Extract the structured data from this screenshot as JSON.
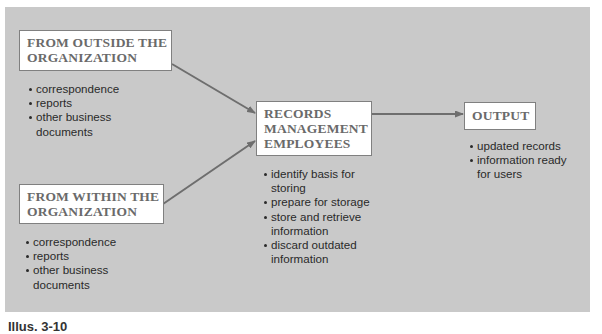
{
  "diagram": {
    "background_color": "#c9c9c9",
    "box_text_color": "#6a6a6a",
    "arrow_color": "#6e6e6e",
    "nodes": [
      {
        "id": "outside",
        "title_lines": [
          "FROM OUTSIDE THE",
          "ORGANIZATION"
        ],
        "items": [
          {
            "lines": [
              "correspondence"
            ]
          },
          {
            "lines": [
              "reports"
            ]
          },
          {
            "lines": [
              "other business",
              "documents"
            ]
          }
        ]
      },
      {
        "id": "within",
        "title_lines": [
          "FROM WITHIN THE",
          "ORGANIZATION"
        ],
        "items": [
          {
            "lines": [
              "correspondence"
            ]
          },
          {
            "lines": [
              "reports"
            ]
          },
          {
            "lines": [
              "other business",
              "documents"
            ]
          }
        ]
      },
      {
        "id": "records",
        "title_lines": [
          "RECORDS",
          "MANAGEMENT",
          "EMPLOYEES"
        ],
        "items": [
          {
            "lines": [
              "identify basis for",
              "storing"
            ]
          },
          {
            "lines": [
              "prepare for storage"
            ]
          },
          {
            "lines": [
              "store and retrieve",
              "information"
            ]
          },
          {
            "lines": [
              "discard outdated",
              "information"
            ]
          }
        ]
      },
      {
        "id": "output",
        "title_lines": [
          "OUTPUT"
        ],
        "items": [
          {
            "lines": [
              "updated records"
            ]
          },
          {
            "lines": [
              "information ready",
              "for users"
            ]
          }
        ]
      }
    ],
    "edges": [
      {
        "from": "outside",
        "to": "records"
      },
      {
        "from": "within",
        "to": "records"
      },
      {
        "from": "records",
        "to": "output"
      }
    ]
  },
  "caption": "Illus. 3-10"
}
